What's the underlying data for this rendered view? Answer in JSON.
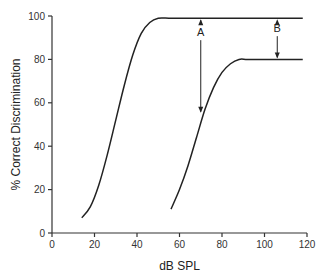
{
  "chart_data": {
    "type": "line",
    "title": "",
    "xlabel": "dB SPL",
    "ylabel": "% Correct Discrimination",
    "xlim": [
      0,
      120
    ],
    "ylim": [
      0,
      100
    ],
    "xticks": [
      0,
      20,
      40,
      60,
      80,
      100,
      120
    ],
    "yticks": [
      0,
      20,
      40,
      60,
      80,
      100
    ],
    "xtick_labels": [
      "0",
      "20",
      "40",
      "60",
      "80",
      "100",
      "120"
    ],
    "ytick_labels": [
      "0",
      "20",
      "40",
      "60",
      "80",
      "100"
    ],
    "grid": false,
    "series": [
      {
        "name": "normal",
        "x": [
          14,
          18,
          22,
          26,
          30,
          34,
          38,
          42,
          46,
          50,
          55,
          60,
          80,
          100,
          118
        ],
        "y": [
          7,
          12,
          22,
          36,
          52,
          68,
          82,
          92,
          97,
          99,
          99,
          99,
          99,
          99,
          99
        ]
      },
      {
        "name": "impaired",
        "x": [
          56,
          60,
          64,
          68,
          72,
          76,
          80,
          84,
          88,
          92,
          100,
          110,
          118
        ],
        "y": [
          11,
          20,
          31,
          44,
          57,
          67,
          74,
          78,
          80,
          80,
          80,
          80,
          80
        ]
      }
    ],
    "annotations": [
      {
        "label": "A",
        "x": 70,
        "y_from": 99,
        "y_to": 55,
        "type": "double-arrow"
      },
      {
        "label": "B",
        "x": 106,
        "y_from": 99,
        "y_to": 80,
        "type": "double-arrow"
      }
    ]
  }
}
